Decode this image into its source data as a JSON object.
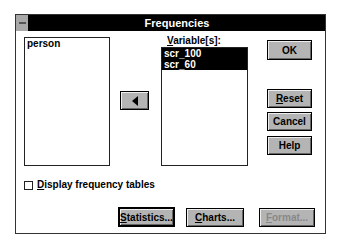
{
  "window": {
    "title": "Frequencies"
  },
  "source_list": {
    "items": [
      "person"
    ]
  },
  "variables": {
    "label_prefix": "V",
    "label_rest": "ariable[s]:",
    "items": [
      "scr_100",
      "scr_60"
    ]
  },
  "move_button": {
    "icon": "left-arrow-icon"
  },
  "buttons": {
    "ok": "OK",
    "reset_u": "R",
    "reset_rest": "eset",
    "cancel": "Cancel",
    "help": "Help"
  },
  "checkbox": {
    "label_u": "D",
    "label_rest": "isplay frequency tables",
    "checked": false
  },
  "bottom_buttons": {
    "statistics_u": "S",
    "statistics_rest": "tatistics...",
    "charts_u": "C",
    "charts_rest": "harts...",
    "format_u": "F",
    "format_rest": "ormat..."
  }
}
